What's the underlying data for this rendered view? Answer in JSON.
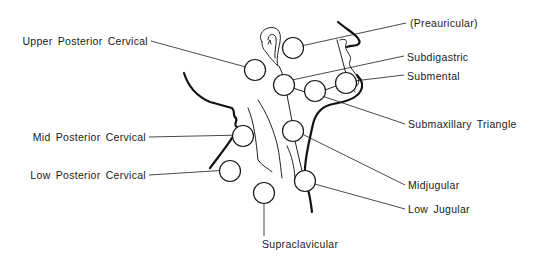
{
  "diagram": {
    "colors": {
      "ink": "#1a1a1a",
      "background": "#ffffff"
    },
    "labels": {
      "preauricular": "(Preauricular)",
      "upper_posterior_cervical": "Upper Posterior Cervical",
      "subdigastric": "Subdigastric",
      "submental": "Submental",
      "submaxillary_triangle": "Submaxillary Triangle",
      "mid_posterior_cervical": "Mid Posterior Cervical",
      "low_posterior_cervical": "Low Posterior Cervical",
      "midjugular": "Midjugular",
      "low_jugular": "Low Jugular",
      "supraclavicular": "Supraclavicular"
    },
    "nodes": [
      {
        "id": "preauricular",
        "cx": 293,
        "cy": 48
      },
      {
        "id": "upper_posterior_cervical",
        "cx": 255,
        "cy": 70
      },
      {
        "id": "subdigastric",
        "cx": 284,
        "cy": 85
      },
      {
        "id": "submaxillary_triangle",
        "cx": 315,
        "cy": 91
      },
      {
        "id": "submental",
        "cx": 346,
        "cy": 83
      },
      {
        "id": "midjugular",
        "cx": 293,
        "cy": 131
      },
      {
        "id": "low_jugular",
        "cx": 305,
        "cy": 181
      },
      {
        "id": "mid_posterior_cervical",
        "cx": 243,
        "cy": 136
      },
      {
        "id": "low_posterior_cervical",
        "cx": 230,
        "cy": 171
      },
      {
        "id": "supraclavicular",
        "cx": 264,
        "cy": 195
      }
    ]
  }
}
